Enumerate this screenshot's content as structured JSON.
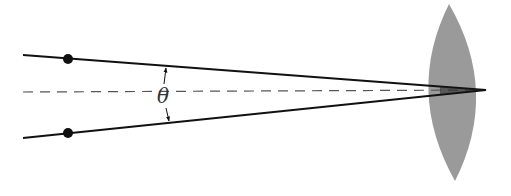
{
  "diagram": {
    "angle_label": "θ",
    "colors": {
      "background": "#ffffff",
      "ray": "#111111",
      "axis": "#555555",
      "lens_fill": "#9a9a9a",
      "dot": "#111111"
    },
    "elements": {
      "upper_ray": {
        "x1": 23,
        "y1": 55,
        "x2": 486,
        "y2": 90
      },
      "lower_ray": {
        "x1": 23,
        "y1": 138,
        "x2": 486,
        "y2": 90
      },
      "optical_axis": {
        "x1": 23,
        "y1": 92,
        "x2": 486,
        "y2": 90
      },
      "upper_point": {
        "cx": 68,
        "cy": 59,
        "r": 5
      },
      "lower_point": {
        "cx": 68,
        "cy": 133,
        "r": 5
      },
      "lens": {
        "top": [
          449,
          4
        ],
        "bottom": [
          455,
          181
        ],
        "left_x": 419,
        "right_x": 488
      },
      "angle_label_pos": {
        "x": 163,
        "y": 103
      }
    }
  }
}
